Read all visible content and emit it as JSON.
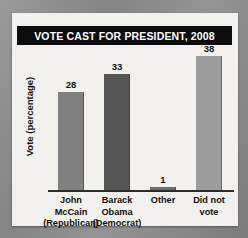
{
  "chart_data": {
    "type": "bar",
    "title": "VOTE CAST FOR PRESIDENT, 2008",
    "xlabel": "",
    "ylabel": "Vote (percentage)",
    "ylim": [
      0,
      40
    ],
    "grid": false,
    "legend": "none",
    "categories": [
      "John McCain (Republican)",
      "Barack Obama (Democrat)",
      "Other",
      "Did not vote"
    ],
    "values": [
      28,
      33,
      1,
      38
    ],
    "bars": [
      {
        "category": "John McCain (Republican)",
        "label_lines": [
          "John",
          "McCain",
          "(Republican)"
        ],
        "value": 28,
        "value_label": "28",
        "color": "#808080"
      },
      {
        "category": "Barack Obama (Democrat)",
        "label_lines": [
          "Barack",
          "Obama",
          "(Democrat)"
        ],
        "value": 33,
        "value_label": "33",
        "color": "#555555"
      },
      {
        "category": "Other",
        "label_lines": [
          "Other"
        ],
        "value": 1,
        "value_label": "1",
        "color": "#6e6e6e"
      },
      {
        "category": "Did not vote",
        "label_lines": [
          "Did not",
          "vote"
        ],
        "value": 38,
        "value_label": "38",
        "color": "#9d9d9d"
      }
    ]
  },
  "colors": {
    "title_bar_background": "#0c0c0c",
    "title_text": "#ffffff",
    "card_background": "#f2f1ee",
    "axis_line": "#2b2b2b",
    "page_background": "#8d8d8d"
  }
}
